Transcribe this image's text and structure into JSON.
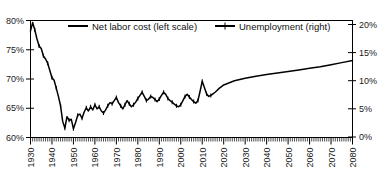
{
  "chart_data": {
    "type": "line",
    "title": "",
    "xlabel": "",
    "ylabel": "",
    "grid": false,
    "legend_position": "top-center",
    "xlim": [
      1930,
      2080
    ],
    "xticks": [
      1930,
      1940,
      1950,
      1960,
      1970,
      1980,
      1990,
      2000,
      2010,
      2020,
      2030,
      2040,
      2050,
      2060,
      2070,
      2080
    ],
    "xtick_labels": [
      "1930",
      "1940",
      "1950",
      "1960",
      "1970",
      "1980",
      "1990",
      "2000",
      "2010",
      "2020",
      "2030",
      "2040",
      "2050",
      "2060",
      "2070",
      "2080"
    ],
    "minor_tick_interval": 1,
    "left_axis": {
      "label": "",
      "ylim": [
        57.5,
        80
      ],
      "yticks": [
        60,
        65,
        70,
        75,
        80
      ],
      "ytick_labels": [
        "60%",
        "65%",
        "70%",
        "75%",
        "80%"
      ]
    },
    "right_axis": {
      "label": "",
      "ylim": [
        0,
        22.5
      ],
      "yticks": [
        0,
        5,
        10,
        15,
        20
      ],
      "ytick_labels": [
        "0%",
        "5%",
        "10%",
        "15%",
        "20%"
      ]
    },
    "series": [
      {
        "name": "Net labor cost (left scale)",
        "axis": "left",
        "marker": "none",
        "color": "#000000",
        "x": [],
        "values": []
      },
      {
        "name": "Unemployment (right)",
        "axis": "right",
        "marker": "plus",
        "color": "#000000",
        "x": [
          1930,
          1931,
          1932,
          1933,
          1934,
          1935,
          1936,
          1937,
          1938,
          1939,
          1940,
          1941,
          1942,
          1943,
          1944,
          1945,
          1946,
          1947,
          1948,
          1949,
          1950,
          1951,
          1952,
          1953,
          1954,
          1955,
          1956,
          1957,
          1958,
          1959,
          1960,
          1961,
          1962,
          1963,
          1964,
          1965,
          1966,
          1967,
          1968,
          1969,
          1970,
          1971,
          1972,
          1973,
          1974,
          1975,
          1976,
          1977,
          1978,
          1979,
          1980,
          1981,
          1982,
          1983,
          1984,
          1985,
          1986,
          1987,
          1988,
          1989,
          1990,
          1991,
          1992,
          1993,
          1994,
          1995,
          1996,
          1997,
          1998,
          1999,
          2000,
          2001,
          2002,
          2003,
          2004,
          2005,
          2006,
          2007,
          2008,
          2009,
          2010,
          2011,
          2012,
          2013,
          2014,
          2015,
          2016,
          2017,
          2018,
          2019,
          2020,
          2025,
          2030,
          2035,
          2040,
          2045,
          2050,
          2055,
          2060,
          2065,
          2070,
          2075,
          2080
        ],
        "values": [
          78.0,
          79.6,
          78.2,
          76.5,
          75.1,
          74.6,
          73.2,
          72.6,
          71.8,
          70.4,
          69.0,
          68.5,
          67.0,
          65.4,
          63.6,
          60.6,
          59.3,
          61.5,
          60.8,
          61.0,
          59.2,
          60.4,
          61.8,
          62.0,
          61.2,
          62.4,
          63.2,
          62.6,
          63.4,
          62.8,
          63.8,
          63.0,
          63.4,
          62.6,
          62.2,
          62.8,
          63.6,
          64.2,
          64.0,
          64.6,
          65.2,
          64.2,
          63.6,
          63.0,
          63.8,
          64.6,
          64.0,
          63.4,
          63.8,
          64.3,
          65.0,
          65.6,
          66.2,
          65.4,
          64.6,
          64.9,
          65.4,
          65.2,
          64.8,
          64.4,
          64.9,
          65.6,
          66.2,
          65.8,
          65.0,
          64.6,
          64.3,
          63.9,
          63.6,
          63.4,
          63.8,
          64.6,
          65.4,
          65.8,
          65.3,
          64.8,
          64.4,
          64.1,
          64.6,
          66.4,
          68.3,
          67.1,
          65.9,
          65.4,
          65.6,
          65.9,
          66.2,
          66.6,
          67.0,
          67.3,
          67.6,
          68.4,
          68.9,
          69.3,
          69.6,
          69.9,
          70.2,
          70.5,
          70.8,
          71.1,
          71.5,
          71.9,
          72.3
        ],
        "note": "Plotted as a single connected trace; pre-2014 values are annual observations with plus markers, post-2014 values are a smooth projection."
      }
    ],
    "annotations": []
  },
  "legend": {
    "entries": [
      {
        "label": "Net labor cost (left scale)",
        "marker": "line"
      },
      {
        "label": "Unemployment (right)",
        "marker": "line-plus"
      }
    ]
  }
}
